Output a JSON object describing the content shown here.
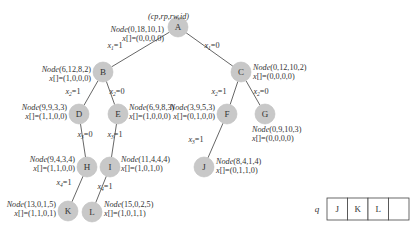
{
  "header_label": "(cp,rp,rw,id)",
  "nodes": [
    {
      "id": "A",
      "label": "A",
      "node": "(0,18,10,1)",
      "x": "(0,0,0,0)"
    },
    {
      "id": "B",
      "label": "B",
      "node": "(6,12,8,2)",
      "x": "(1,0,0,0)"
    },
    {
      "id": "C",
      "label": "C",
      "node": "(0,12,10,2)",
      "x": "(0,0,0,0)"
    },
    {
      "id": "D",
      "label": "D",
      "node": "(9,9,3,3)",
      "x": "(1,1,0,0)"
    },
    {
      "id": "E",
      "label": "E",
      "node": "(6,9,8,3)",
      "x": "(1,0,0,0)"
    },
    {
      "id": "F",
      "label": "F",
      "node": "(3,9,5,3)",
      "x": "(0,1,0,0)"
    },
    {
      "id": "G",
      "label": "G",
      "node": "(0,9,10,3)",
      "x": "(0,0,0,0)"
    },
    {
      "id": "H",
      "label": "H",
      "node": "(9,4,3,4)",
      "x": "(1,1,0,0)"
    },
    {
      "id": "I",
      "label": "I",
      "node": "(11,4,4,4)",
      "x": "(1,0,1,0)"
    },
    {
      "id": "J",
      "label": "J",
      "node": "(8,4,1,4)",
      "x": "(0,1,1,0)"
    },
    {
      "id": "K",
      "label": "K",
      "node": "(13,0,1,5)",
      "x": "(1,1,0,1)"
    },
    {
      "id": "L",
      "label": "L",
      "node": "(15,0,2,5)",
      "x": "(1,0,1,1)"
    }
  ],
  "edges": [
    {
      "from": "A",
      "to": "B",
      "label": "x1=1",
      "var": "x",
      "sub": "1",
      "val": "=1"
    },
    {
      "from": "A",
      "to": "C",
      "label": "x1=0",
      "var": "x",
      "sub": "1",
      "val": "=0"
    },
    {
      "from": "B",
      "to": "D",
      "label": "x2=1",
      "var": "x",
      "sub": "2",
      "val": "=1"
    },
    {
      "from": "B",
      "to": "E",
      "label": "x2=0",
      "var": "x",
      "sub": "2",
      "val": "=0"
    },
    {
      "from": "C",
      "to": "F",
      "label": "x2=1",
      "var": "x",
      "sub": "2",
      "val": "=1"
    },
    {
      "from": "C",
      "to": "G",
      "label": "x2=0",
      "var": "x",
      "sub": "2",
      "val": "=0"
    },
    {
      "from": "D",
      "to": "H",
      "label": "x3=0",
      "var": "x",
      "sub": "3",
      "val": "=0"
    },
    {
      "from": "E",
      "to": "I",
      "label": "x3=1",
      "var": "x",
      "sub": "3",
      "val": "=1"
    },
    {
      "from": "F",
      "to": "J",
      "label": "x3=1",
      "var": "x",
      "sub": "3",
      "val": "=1"
    },
    {
      "from": "H",
      "to": "K",
      "label": "x4=1",
      "var": "x",
      "sub": "4",
      "val": "=1"
    },
    {
      "from": "I",
      "to": "L",
      "label": "x4=1",
      "var": "x",
      "sub": "4",
      "val": "=1"
    }
  ],
  "node_prefix": "Node",
  "x_prefix": "x[]=",
  "queue": {
    "label": "q",
    "cells": [
      "J",
      "K",
      "L",
      ""
    ]
  }
}
